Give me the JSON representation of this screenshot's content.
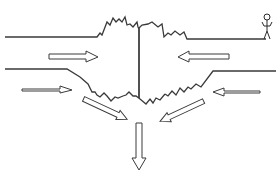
{
  "diagram": {
    "type": "schematic",
    "colors": {
      "stroke": "#3a3a3a",
      "background": "#ffffff",
      "arrow_fill": "#ffffff"
    },
    "elements": {
      "surface_left": "upper-left horizontal surface line",
      "surface_right": "upper-right horizontal surface line",
      "rift_crest": "jagged rift edges at top center",
      "central_fault": "vertical line at center",
      "lower_boundary": "lower jagged boundary forming V shape",
      "arrows": [
        {
          "id": "top-left",
          "direction": "right"
        },
        {
          "id": "top-right",
          "direction": "left"
        },
        {
          "id": "mid-left",
          "direction": "right"
        },
        {
          "id": "mid-right",
          "direction": "left"
        },
        {
          "id": "diag-left",
          "direction": "down-right"
        },
        {
          "id": "diag-right",
          "direction": "down-left"
        },
        {
          "id": "bottom",
          "direction": "down"
        }
      ],
      "figure": "stick-person"
    }
  }
}
